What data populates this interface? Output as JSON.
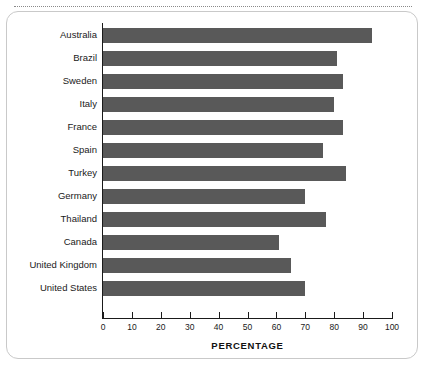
{
  "chart_data": {
    "type": "bar",
    "orientation": "horizontal",
    "title": "",
    "xlabel": "PERCENTAGE",
    "ylabel": "",
    "xlim": [
      0,
      100
    ],
    "grid": false,
    "legend": null,
    "bar_color": "#595959",
    "axis_color": "#1a1a1a",
    "xticks": [
      0,
      10,
      20,
      30,
      40,
      50,
      60,
      70,
      80,
      90,
      100
    ],
    "xtick_labels": [
      "0",
      "10",
      "20",
      "30",
      "40",
      "50",
      "60",
      "70",
      "80",
      "90",
      "100"
    ],
    "categories": [
      "Australia",
      "Brazil",
      "Sweden",
      "Italy",
      "France",
      "Spain",
      "Turkey",
      "Germany",
      "Thailand",
      "Canada",
      "United Kingdom",
      "United States"
    ],
    "values": [
      93,
      81,
      83,
      80,
      83,
      76,
      84,
      70,
      77,
      61,
      65,
      70
    ]
  },
  "page": {
    "background": "#ffffff",
    "card_border_color": "#c9c9c9",
    "dotted_rule_color": "#8a8a8a"
  }
}
